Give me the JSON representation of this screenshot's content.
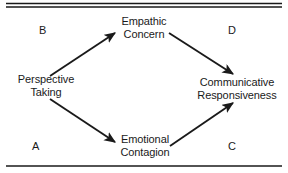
{
  "figure": {
    "type": "path-model-diagram",
    "shape": "diamond",
    "background_color": "#ffffff",
    "line_color": "#1a1a1a",
    "rules": {
      "top_style": "double",
      "bottom_style": "single"
    }
  },
  "nodes": {
    "perspective_taking": {
      "line1": "Perspective",
      "line2": "Taking",
      "position": "left"
    },
    "empathic_concern": {
      "line1": "Empathic",
      "line2": "Concern",
      "position": "top-center"
    },
    "emotional_contagion": {
      "line1": "Emotional",
      "line2": "Contagion",
      "position": "bottom-center"
    },
    "communicative_responsiveness": {
      "line1": "Communicative",
      "line2": "Responsiveness",
      "position": "right"
    }
  },
  "corner_letters": {
    "top_left": "B",
    "top_right": "D",
    "bottom_left": "A",
    "bottom_right": "C"
  },
  "arrows": [
    {
      "id": "pt-to-ec",
      "from": "Perspective Taking",
      "to": "Empathic Concern",
      "direction": "up-right"
    },
    {
      "id": "ec-to-cr",
      "from": "Empathic Concern",
      "to": "Communicative Responsiveness",
      "direction": "down-right"
    },
    {
      "id": "pt-to-ect",
      "from": "Perspective Taking",
      "to": "Emotional Contagion",
      "direction": "down-right"
    },
    {
      "id": "ect-to-cr",
      "from": "Emotional Contagion",
      "to": "Communicative Responsiveness",
      "direction": "up-right"
    }
  ]
}
